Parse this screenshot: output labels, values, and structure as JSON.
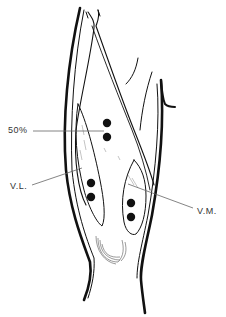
{
  "diagram": {
    "labels": {
      "midpoint": "50%",
      "vastus_lateralis": "V.L.",
      "vastus_medialis": "V.M."
    },
    "points": {
      "midpoint_pair": [
        [
          107,
          123
        ],
        [
          107,
          137
        ]
      ],
      "vastus_lateralis_pair": [
        [
          91,
          183
        ],
        [
          91,
          197
        ]
      ],
      "vastus_medialis_pair": [
        [
          131,
          203
        ],
        [
          131,
          217
        ]
      ]
    },
    "colors": {
      "ink": "#111111",
      "leader": "#666666",
      "background": "#ffffff"
    }
  }
}
